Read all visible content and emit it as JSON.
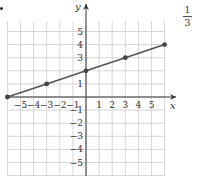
{
  "chart_data": {
    "type": "line",
    "title": "",
    "xlabel": "x",
    "ylabel": "y",
    "x_tick_labels": [
      "-5",
      "-4",
      "-3",
      "-2",
      "-1",
      "1",
      "2",
      "3",
      "4",
      "5"
    ],
    "y_tick_labels": [
      "5",
      "4",
      "3",
      "1",
      "-1",
      "-2",
      "-3",
      "-4",
      "-5"
    ],
    "xlim": [
      -6,
      6
    ],
    "ylim": [
      -6,
      6
    ],
    "grid": true,
    "series": [
      {
        "name": "line",
        "points": [
          [
            -6,
            0
          ],
          [
            -3,
            1
          ],
          [
            0,
            2
          ],
          [
            3,
            3
          ],
          [
            6,
            4
          ]
        ],
        "color": "#555555"
      }
    ]
  },
  "side_fraction": {
    "numerator": "1",
    "denominator": "3"
  },
  "colors": {
    "grid": "#d6d6d6",
    "axis": "#333333",
    "line": "#555555",
    "point": "#444444"
  }
}
